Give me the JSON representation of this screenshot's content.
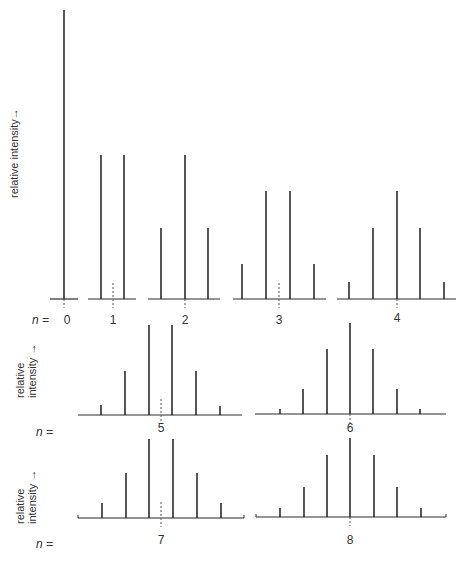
{
  "figure": {
    "y_axis_label_top": "relative intensity→",
    "y_axis_label_mid": [
      "relative",
      "intensity"
    ],
    "y_axis_label_bottom": [
      "relative",
      "intensity"
    ],
    "arrow_glyph": "→",
    "n_prefix": "n =",
    "n_prefix_row1": "n = ",
    "line_color": "#2b2b2b",
    "dash_color": "#555555"
  },
  "panels": [
    {
      "n": "0",
      "label": "0",
      "intensities": [
        1
      ]
    },
    {
      "n": "1",
      "label": "1",
      "intensities": [
        1,
        1
      ]
    },
    {
      "n": "2",
      "label": "2",
      "intensities": [
        1,
        2,
        1
      ]
    },
    {
      "n": "3",
      "label": "3",
      "intensities": [
        1,
        3,
        3,
        1
      ]
    },
    {
      "n": "4",
      "label": "4",
      "intensities": [
        1,
        4,
        6,
        4,
        1
      ]
    },
    {
      "n": "5",
      "label": "5",
      "intensities": [
        1,
        5,
        10,
        10,
        5,
        1
      ]
    },
    {
      "n": "6",
      "label": "6",
      "intensities": [
        1,
        6,
        15,
        20,
        15,
        6,
        1
      ]
    },
    {
      "n": "7",
      "label": "7",
      "intensities": [
        1,
        7,
        21,
        35,
        35,
        21,
        7,
        1
      ]
    },
    {
      "n": "8",
      "label": "8",
      "intensities": [
        1,
        8,
        28,
        56,
        70,
        56,
        28,
        8,
        1
      ]
    }
  ],
  "layout_panels": [
    {
      "id": "p0",
      "base_y": 299,
      "x1": 50,
      "x2": 78,
      "center": 64,
      "dash": true,
      "lines": [
        {
          "x": 64,
          "top": 10
        }
      ]
    },
    {
      "id": "p1",
      "base_y": 299,
      "x1": 88,
      "x2": 136,
      "center": 113,
      "dash": true,
      "lines": [
        {
          "x": 101,
          "top": 155
        },
        {
          "x": 124,
          "top": 155
        }
      ]
    },
    {
      "id": "p2",
      "base_y": 299,
      "x1": 148,
      "x2": 220,
      "center": 185,
      "dash": true,
      "lines": [
        {
          "x": 161,
          "top": 228
        },
        {
          "x": 185,
          "top": 155
        },
        {
          "x": 208,
          "top": 228
        }
      ]
    },
    {
      "id": "p3",
      "base_y": 299,
      "x1": 233,
      "x2": 326,
      "center": 279,
      "dash": true,
      "lines": [
        {
          "x": 242,
          "top": 264
        },
        {
          "x": 266,
          "top": 191
        },
        {
          "x": 290,
          "top": 191
        },
        {
          "x": 314,
          "top": 264
        }
      ]
    },
    {
      "id": "p4",
      "base_y": 299,
      "x1": 337,
      "x2": 456,
      "center": 397,
      "dash": true,
      "lines": [
        {
          "x": 349,
          "top": 282
        },
        {
          "x": 373,
          "top": 228
        },
        {
          "x": 397,
          "top": 191
        },
        {
          "x": 420,
          "top": 228
        },
        {
          "x": 444,
          "top": 282
        }
      ]
    },
    {
      "id": "p5",
      "base_y": 415,
      "x1": 78,
      "x2": 242,
      "center": 161,
      "dash": true,
      "lines": [
        {
          "x": 101,
          "top": 405
        },
        {
          "x": 125,
          "top": 371
        },
        {
          "x": 149,
          "top": 325
        },
        {
          "x": 172,
          "top": 325
        },
        {
          "x": 196,
          "top": 371
        },
        {
          "x": 220,
          "top": 406
        }
      ]
    },
    {
      "id": "p6",
      "base_y": 414,
      "x1": 255,
      "x2": 446,
      "center": 350,
      "dash": true,
      "lines": [
        {
          "x": 280,
          "top": 409
        },
        {
          "x": 303,
          "top": 389
        },
        {
          "x": 327,
          "top": 349
        },
        {
          "x": 350,
          "top": 323
        },
        {
          "x": 373,
          "top": 349
        },
        {
          "x": 397,
          "top": 389
        },
        {
          "x": 420,
          "top": 409
        }
      ]
    },
    {
      "id": "p7",
      "base_y": 518,
      "x1": 78,
      "x2": 244,
      "center": 161,
      "dash": true,
      "lines": [
        {
          "x": 102,
          "top": 503
        },
        {
          "x": 126,
          "top": 473
        },
        {
          "x": 149,
          "top": 439
        },
        {
          "x": 173,
          "top": 439
        },
        {
          "x": 197,
          "top": 473
        },
        {
          "x": 221,
          "top": 503
        }
      ]
    },
    {
      "id": "p8",
      "base_y": 517,
      "x1": 256,
      "x2": 446,
      "center": 350,
      "dash": true,
      "lines": [
        {
          "x": 280,
          "top": 508
        },
        {
          "x": 304,
          "top": 487
        },
        {
          "x": 327,
          "top": 455
        },
        {
          "x": 350,
          "top": 438
        },
        {
          "x": 374,
          "top": 455
        },
        {
          "x": 397,
          "top": 487
        },
        {
          "x": 421,
          "top": 508
        }
      ]
    }
  ]
}
